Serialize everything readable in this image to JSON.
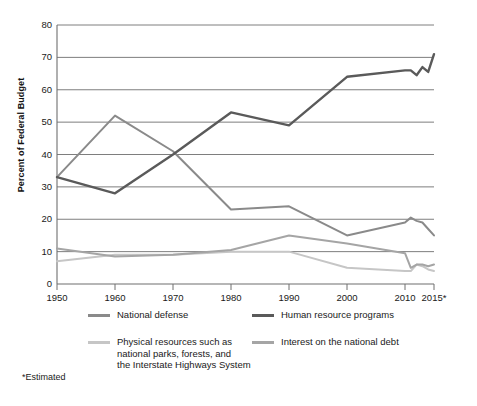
{
  "chart_data": {
    "type": "line",
    "title": "",
    "xlabel": "",
    "ylabel": "Percent of Federal Budget",
    "xlim": [
      1950,
      2015
    ],
    "ylim": [
      0,
      80
    ],
    "grid": true,
    "legend_position": "bottom",
    "x": [
      1950,
      1960,
      1970,
      1980,
      1990,
      2000,
      2010,
      2011,
      2012,
      2013,
      2014,
      2015
    ],
    "xtick_labels": [
      "1950",
      "1960",
      "1970",
      "1980",
      "1990",
      "2000",
      "2010",
      "2015*"
    ],
    "xtick_values": [
      1950,
      1960,
      1970,
      1980,
      1990,
      2000,
      2010,
      2015
    ],
    "ytick_labels": [
      "0",
      "10",
      "20",
      "30",
      "40",
      "50",
      "60",
      "70",
      "80"
    ],
    "ytick_values": [
      0,
      10,
      20,
      30,
      40,
      50,
      60,
      70,
      80
    ],
    "series": [
      {
        "name": "National defense",
        "color": "#8a8a8a",
        "values": [
          33,
          52,
          41,
          23,
          24,
          15,
          19,
          20.5,
          19.5,
          19,
          17,
          15
        ]
      },
      {
        "name": "Human resource programs",
        "color": "#5a5a5a",
        "values": [
          33,
          28,
          40,
          53,
          49,
          64,
          66,
          66,
          64.5,
          67,
          65.5,
          71
        ]
      },
      {
        "name": "Physical resources such as\nnational parks, forests, and\nthe Interstate Highways System",
        "color": "#c6c6c6",
        "values": [
          7,
          9,
          9,
          10,
          10,
          5,
          4,
          4,
          6,
          5.5,
          4.5,
          4
        ]
      },
      {
        "name": "Interest on the national debt",
        "color": "#a5a5a5",
        "values": [
          11,
          8.5,
          9,
          10.5,
          15,
          12.5,
          9.5,
          5,
          6,
          6,
          5.5,
          6
        ]
      }
    ],
    "footnote": "*Estimated"
  },
  "legend": {
    "items": [
      {
        "label": "National defense",
        "color": "#8a8a8a"
      },
      {
        "label": "Human resource programs",
        "color": "#5a5a5a"
      },
      {
        "label": "Physical resources such as\nnational parks, forests, and\nthe Interstate Highways System",
        "color": "#c6c6c6"
      },
      {
        "label": "Interest on the national debt",
        "color": "#a5a5a5"
      }
    ]
  },
  "axes": {
    "y_title": "Percent of Federal Budget"
  },
  "footnote": {
    "text": "*Estimated"
  }
}
